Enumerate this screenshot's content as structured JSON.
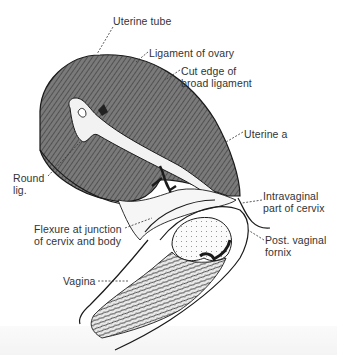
{
  "figure": {
    "colors": {
      "ligament_fill": "#6e6e6e",
      "line": "#1a1a1a",
      "label_text": "#333333",
      "background": "#ffffff"
    },
    "labels": [
      {
        "id": "uterine-tube",
        "text": "Uterine tube",
        "x": 113,
        "y": 15
      },
      {
        "id": "ligament-of-ovary",
        "text": "Ligament of ovary",
        "x": 149,
        "y": 47
      },
      {
        "id": "cut-edge-broad-ligament",
        "text": "Cut edge of\nbroad ligament",
        "x": 181,
        "y": 65
      },
      {
        "id": "uterine-artery",
        "text": "Uterine a",
        "x": 244,
        "y": 128
      },
      {
        "id": "round-ligament",
        "text": "Round\nlig.",
        "x": 13,
        "y": 172
      },
      {
        "id": "intravaginal-cervix",
        "text": "Intravaginal\npart of cervix",
        "x": 263,
        "y": 190
      },
      {
        "id": "flexure",
        "text": "Flexure at junction\nof cervix and body",
        "x": 34,
        "y": 223
      },
      {
        "id": "post-vaginal-fornix",
        "text": "Post. vaginal\nfornix",
        "x": 265,
        "y": 234
      },
      {
        "id": "vagina",
        "text": "Vagina",
        "x": 63,
        "y": 275
      }
    ]
  }
}
